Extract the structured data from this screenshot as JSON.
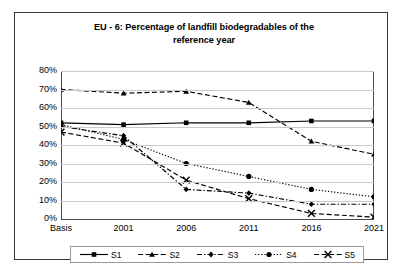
{
  "chart_data": {
    "type": "line",
    "title": "EU - 6: Percentage of landfill biodegradables of the reference year",
    "title_line1": "EU - 6: Percentage of landfill biodegradables of the",
    "title_line2": "reference year",
    "xlabel": "",
    "ylabel": "",
    "categories": [
      "Basis",
      "2001",
      "2006",
      "2011",
      "2016",
      "2021"
    ],
    "ylim": [
      0,
      80
    ],
    "ytick_labels": [
      "80%",
      "70%",
      "60%",
      "50%",
      "40%",
      "30%",
      "20%",
      "10%",
      "0%"
    ],
    "ytick_values": [
      80,
      70,
      60,
      50,
      40,
      30,
      20,
      10,
      0
    ],
    "grid": true,
    "legend_position": "bottom",
    "series": [
      {
        "name": "S1",
        "values": [
          52,
          51,
          52,
          52,
          53,
          53
        ],
        "marker": "square",
        "line_style": "solid",
        "color": "#000000"
      },
      {
        "name": "S2",
        "values": [
          70,
          68,
          69,
          63,
          42,
          35
        ],
        "marker": "triangle",
        "line_style": "dashed",
        "color": "#000000"
      },
      {
        "name": "S3",
        "values": [
          50,
          45,
          16,
          14,
          8,
          8
        ],
        "marker": "diamond",
        "line_style": "dash-dot",
        "color": "#000000"
      },
      {
        "name": "S4",
        "values": [
          51,
          43,
          30,
          23,
          16,
          12
        ],
        "marker": "circle",
        "line_style": "dotted",
        "color": "#000000"
      },
      {
        "name": "S5",
        "values": [
          47,
          41,
          21,
          11,
          3,
          1
        ],
        "marker": "x",
        "line_style": "dashed",
        "color": "#000000"
      }
    ]
  },
  "legend": {
    "items": [
      {
        "label": "S1"
      },
      {
        "label": "S2"
      },
      {
        "label": "S3"
      },
      {
        "label": "S4"
      },
      {
        "label": "S5"
      }
    ]
  }
}
